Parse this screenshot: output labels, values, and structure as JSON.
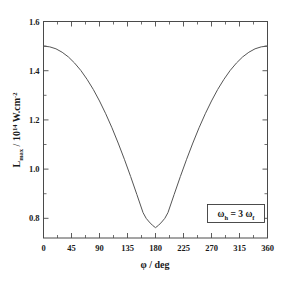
{
  "chart_data": {
    "type": "line",
    "title": "",
    "xlabel": "φ / deg",
    "ylabel_main": "L",
    "ylabel_sub": "max",
    "ylabel_rest": " / 10",
    "ylabel_exp": "14",
    "ylabel_tail": " W.cm",
    "ylabel_exp2": "-2",
    "ylabel_full": "L_max / 10^14 W.cm^-2",
    "xlim": [
      0,
      360
    ],
    "ylim": [
      0.72,
      1.6
    ],
    "grid": false,
    "legend": "none",
    "xticks": [
      0,
      45,
      90,
      135,
      180,
      225,
      270,
      315,
      360
    ],
    "xticklabels": [
      "0",
      "45",
      "90",
      "135",
      "180",
      "225",
      "270",
      "315",
      "360"
    ],
    "xminorticks": [
      22.5,
      67.5,
      112.5,
      157.5,
      202.5,
      247.5,
      292.5,
      337.5
    ],
    "yticks": [
      0.8,
      1.0,
      1.2,
      1.4,
      1.6
    ],
    "yticklabels": [
      "0.8",
      "1.0",
      "1.2",
      "1.4",
      "1.6"
    ],
    "yminorticks": [
      0.9,
      1.1,
      1.3,
      1.5
    ],
    "annotations": [
      {
        "text": "ωh = 3 ωf",
        "omega1": "ω",
        "sub1": "h",
        "mid": " = 3 ",
        "omega2": "ω",
        "sub2": "f",
        "boxed": true,
        "x": 300,
        "y": 0.84
      }
    ],
    "series": [
      {
        "name": "Lmax",
        "color": "#555555",
        "x": [
          0,
          10,
          20,
          30,
          40,
          50,
          60,
          70,
          80,
          90,
          100,
          110,
          120,
          130,
          140,
          150,
          160,
          165,
          170,
          175,
          180,
          185,
          190,
          195,
          200,
          210,
          220,
          230,
          240,
          250,
          260,
          270,
          280,
          290,
          300,
          310,
          320,
          330,
          340,
          350,
          360
        ],
        "y": [
          1.5,
          1.497,
          1.489,
          1.475,
          1.456,
          1.431,
          1.401,
          1.365,
          1.324,
          1.277,
          1.225,
          1.168,
          1.106,
          1.04,
          0.97,
          0.897,
          0.823,
          0.8,
          0.785,
          0.772,
          0.762,
          0.772,
          0.785,
          0.8,
          0.823,
          0.897,
          0.97,
          1.04,
          1.106,
          1.168,
          1.225,
          1.277,
          1.324,
          1.365,
          1.401,
          1.431,
          1.456,
          1.475,
          1.489,
          1.497,
          1.5
        ]
      }
    ]
  },
  "colors": {
    "background": "#ffffff",
    "axis": "#4a4a4a",
    "curve": "#555555",
    "text": "#1a1a1a"
  }
}
